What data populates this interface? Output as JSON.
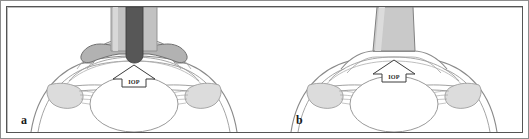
{
  "figure": {
    "panels": [
      {
        "id": "a",
        "label": "a",
        "method": "indentation-tonometry",
        "probe_name": "indentation-tonometer-probe",
        "probe_shape": "plunger-with-mushroom-footplate",
        "cornea_state": "indented",
        "arrow_label": "IOP",
        "arrow_direction": "up"
      },
      {
        "id": "b",
        "label": "b",
        "method": "applanation-tonometry",
        "probe_name": "applanation-tonometer-probe",
        "probe_shape": "flat-trapezoid-tip",
        "cornea_state": "applanated-flattened",
        "arrow_label": "IOP",
        "arrow_direction": "up"
      }
    ]
  },
  "colors": {
    "frame_outer": "#8d8d8d",
    "frame_inner": "#555555",
    "background": "#ffffff",
    "probe_dark_rod": "#575757",
    "probe_sleeve": "#a3a3a3",
    "probe_flat": "#c9c9c9",
    "outline": "#7a7a7a",
    "tissue_fill": "#d8d8d8",
    "arrow_fill": "#ffffff",
    "arrow_stroke": "#3c3c3c",
    "label_text": "#1a1a1a"
  }
}
